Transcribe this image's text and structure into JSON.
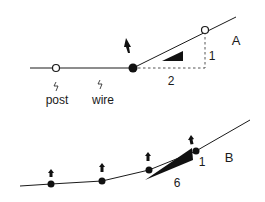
{
  "figure_a": {
    "label": "A",
    "slope_rise": "1",
    "slope_run": "2",
    "post_label": "post",
    "wire_label": "wire"
  },
  "figure_b": {
    "label": "B",
    "slope_rise": "1",
    "slope_run": "6"
  },
  "colors": {
    "line": "#1a1a1a",
    "dashed": "#555555",
    "background": "#ffffff"
  }
}
